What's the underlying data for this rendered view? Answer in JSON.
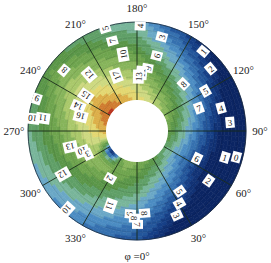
{
  "chart_data": {
    "type": "heatmap",
    "subtype": "polar-annular-contour",
    "title": "",
    "angular_axis": {
      "label_prefix": "φ =",
      "zero_label": "φ =0°",
      "direction": "counterclockwise",
      "zero_position": "bottom",
      "ticks": [
        "φ =0°",
        "30°",
        "60°",
        "90°",
        "120°",
        "150°",
        "180°",
        "210°",
        "240°",
        "270°",
        "300°",
        "330°"
      ],
      "tick_values": [
        0,
        30,
        60,
        90,
        120,
        150,
        180,
        210,
        240,
        270,
        300,
        330
      ]
    },
    "radial_axis": {
      "inner_hole": true,
      "grid": "spokes every 30°"
    },
    "colormap": [
      "#0d2a6e",
      "#1f4f96",
      "#3f7fba",
      "#6aa8cf",
      "#7ab89a",
      "#6aa35a",
      "#5f9a48",
      "#8cb85a",
      "#c9d77a",
      "#e6d26a",
      "#e2a040",
      "#c9501f",
      "#b8281a"
    ],
    "contour_levels": [
      0,
      1,
      2,
      3,
      4,
      5,
      6,
      7,
      8,
      9,
      10,
      11,
      12,
      13,
      14,
      15,
      16,
      17
    ],
    "contour_labels": [
      {
        "text": "0",
        "angle_deg": 75,
        "r": 0.92
      },
      {
        "text": "1",
        "angle_deg": 73,
        "r": 0.78
      },
      {
        "text": "2",
        "angle_deg": 55,
        "r": 0.72
      },
      {
        "text": "1",
        "angle_deg": 140,
        "r": 0.93
      },
      {
        "text": "2",
        "angle_deg": 130,
        "r": 0.84
      },
      {
        "text": "3",
        "angle_deg": 165,
        "r": 0.85
      },
      {
        "text": "4",
        "angle_deg": 178,
        "r": 0.95
      },
      {
        "text": "4",
        "angle_deg": 105,
        "r": 0.72
      },
      {
        "text": "3",
        "angle_deg": 95,
        "r": 0.8
      },
      {
        "text": "5",
        "angle_deg": 120,
        "r": 0.62
      },
      {
        "text": "6",
        "angle_deg": 165,
        "r": 0.6
      },
      {
        "text": "7",
        "angle_deg": 110,
        "r": 0.45
      },
      {
        "text": "8",
        "angle_deg": 135,
        "r": 0.45
      },
      {
        "text": "9",
        "angle_deg": 170,
        "r": 0.42
      },
      {
        "text": "11",
        "angle_deg": 175,
        "r": 0.35
      },
      {
        "text": "13",
        "angle_deg": 178,
        "r": 0.3
      },
      {
        "text": "6",
        "angle_deg": 65,
        "r": 0.45
      },
      {
        "text": "5",
        "angle_deg": 35,
        "r": 0.55
      },
      {
        "text": "4",
        "angle_deg": 30,
        "r": 0.68
      },
      {
        "text": "3",
        "angle_deg": 25,
        "r": 0.8
      },
      {
        "text": "5",
        "angle_deg": 197,
        "r": 0.98
      },
      {
        "text": "7",
        "angle_deg": 195,
        "r": 0.8
      },
      {
        "text": "10",
        "angle_deg": 190,
        "r": 0.6
      },
      {
        "text": "8",
        "angle_deg": 230,
        "r": 0.82
      },
      {
        "text": "12",
        "angle_deg": 220,
        "r": 0.55
      },
      {
        "text": "17",
        "angle_deg": 200,
        "r": 0.36
      },
      {
        "text": "9",
        "angle_deg": 252,
        "r": 0.95
      },
      {
        "text": "15",
        "angle_deg": 235,
        "r": 0.4
      },
      {
        "text": "14",
        "angle_deg": 247,
        "r": 0.42
      },
      {
        "text": "16",
        "angle_deg": 255,
        "r": 0.35
      },
      {
        "text": "10",
        "angle_deg": 263,
        "r": 0.95
      },
      {
        "text": "11",
        "angle_deg": 262,
        "r": 0.82
      },
      {
        "text": "13",
        "angle_deg": 283,
        "r": 0.48
      },
      {
        "text": "10",
        "angle_deg": 290,
        "r": 0.35
      },
      {
        "text": "3",
        "angle_deg": 295,
        "r": 0.3
      },
      {
        "text": "2",
        "angle_deg": 330,
        "r": 0.3
      },
      {
        "text": "12",
        "angle_deg": 300,
        "r": 0.7
      },
      {
        "text": "10",
        "angle_deg": 318,
        "r": 0.95
      },
      {
        "text": "11",
        "angle_deg": 340,
        "r": 0.62
      },
      {
        "text": "9",
        "angle_deg": 355,
        "r": 0.67
      },
      {
        "text": "8",
        "angle_deg": 5,
        "r": 0.66
      },
      {
        "text": "8",
        "angle_deg": 358,
        "r": 0.72
      },
      {
        "text": "7",
        "angle_deg": 0,
        "r": 0.8
      }
    ],
    "legend": null,
    "grid": true
  }
}
